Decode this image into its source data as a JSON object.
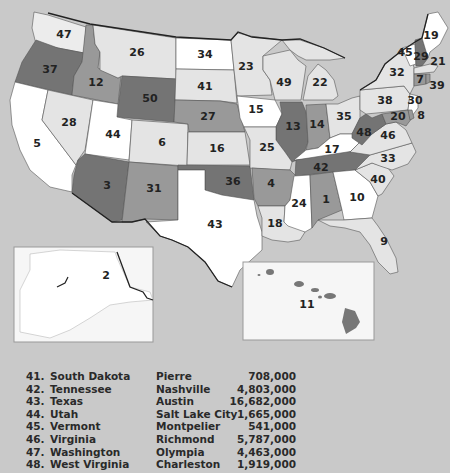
{
  "colors": {
    "background": "#c9c9c9",
    "water": "#c9c9c9",
    "shade_white": "#ffffff",
    "shade_light": "#e4e4e4",
    "shade_medium": "#999999",
    "shade_dark": "#747474",
    "border": "#222222"
  },
  "map": {
    "labels": [
      {
        "num": "47",
        "state": "Washington",
        "x": 64,
        "y": 35
      },
      {
        "num": "37",
        "state": "Oregon",
        "x": 50,
        "y": 70
      },
      {
        "num": "12",
        "state": "Idaho",
        "x": 96,
        "y": 83
      },
      {
        "num": "26",
        "state": "Montana",
        "x": 137,
        "y": 53
      },
      {
        "num": "50",
        "state": "Wyoming",
        "x": 150,
        "y": 99
      },
      {
        "num": "34",
        "state": "North Dakota",
        "x": 205,
        "y": 55
      },
      {
        "num": "41",
        "state": "South Dakota",
        "x": 205,
        "y": 87
      },
      {
        "num": "27",
        "state": "Nebraska",
        "x": 208,
        "y": 117
      },
      {
        "num": "28",
        "state": "Nevada",
        "x": 69,
        "y": 123
      },
      {
        "num": "5",
        "state": "California",
        "x": 37,
        "y": 144
      },
      {
        "num": "44",
        "state": "Utah",
        "x": 113,
        "y": 135
      },
      {
        "num": "6",
        "state": "Colorado",
        "x": 162,
        "y": 143
      },
      {
        "num": "16",
        "state": "Kansas",
        "x": 217,
        "y": 149
      },
      {
        "num": "3",
        "state": "Arizona",
        "x": 107,
        "y": 186
      },
      {
        "num": "31",
        "state": "New Mexico",
        "x": 154,
        "y": 189
      },
      {
        "num": "36",
        "state": "Oklahoma",
        "x": 233,
        "y": 182
      },
      {
        "num": "43",
        "state": "Texas",
        "x": 215,
        "y": 225
      },
      {
        "num": "23",
        "state": "Minnesota",
        "x": 246,
        "y": 67
      },
      {
        "num": "49",
        "state": "Wisconsin",
        "x": 284,
        "y": 83
      },
      {
        "num": "22",
        "state": "Michigan",
        "x": 320,
        "y": 83
      },
      {
        "num": "15",
        "state": "Iowa",
        "x": 256,
        "y": 110
      },
      {
        "num": "13",
        "state": "Illinois",
        "x": 293,
        "y": 127
      },
      {
        "num": "14",
        "state": "Indiana",
        "x": 317,
        "y": 125
      },
      {
        "num": "35",
        "state": "Ohio",
        "x": 344,
        "y": 117
      },
      {
        "num": "25",
        "state": "Missouri",
        "x": 267,
        "y": 148
      },
      {
        "num": "17",
        "state": "Kentucky",
        "x": 332,
        "y": 150
      },
      {
        "num": "42",
        "state": "Tennessee",
        "x": 321,
        "y": 168
      },
      {
        "num": "4",
        "state": "Arkansas",
        "x": 271,
        "y": 184
      },
      {
        "num": "24",
        "state": "Mississippi",
        "x": 299,
        "y": 204
      },
      {
        "num": "1",
        "state": "Alabama",
        "x": 326,
        "y": 200
      },
      {
        "num": "10",
        "state": "Georgia",
        "x": 357,
        "y": 198
      },
      {
        "num": "18",
        "state": "Louisiana",
        "x": 275,
        "y": 224
      },
      {
        "num": "9",
        "state": "Florida",
        "x": 384,
        "y": 242
      },
      {
        "num": "40",
        "state": "South Carolina",
        "x": 378,
        "y": 180
      },
      {
        "num": "33",
        "state": "North Carolina",
        "x": 388,
        "y": 159
      },
      {
        "num": "46",
        "state": "Virginia",
        "x": 388,
        "y": 136
      },
      {
        "num": "48",
        "state": "West Virginia",
        "x": 364,
        "y": 133
      },
      {
        "num": "38",
        "state": "Pennsylvania",
        "x": 385,
        "y": 101
      },
      {
        "num": "32",
        "state": "New York",
        "x": 397,
        "y": 73
      },
      {
        "num": "30",
        "state": "New Jersey",
        "x": 415,
        "y": 101
      },
      {
        "num": "20",
        "state": "Maryland",
        "x": 398,
        "y": 117
      },
      {
        "num": "8",
        "state": "Delaware",
        "x": 421,
        "y": 116
      },
      {
        "num": "19",
        "state": "Maine",
        "x": 431,
        "y": 36
      },
      {
        "num": "45",
        "state": "Vermont",
        "x": 405,
        "y": 53
      },
      {
        "num": "29",
        "state": "New Hampshire",
        "x": 421,
        "y": 57
      },
      {
        "num": "21",
        "state": "Massachusetts",
        "x": 438,
        "y": 62
      },
      {
        "num": "7",
        "state": "Connecticut",
        "x": 420,
        "y": 80
      },
      {
        "num": "39",
        "state": "Rhode Island",
        "x": 437,
        "y": 86
      },
      {
        "num": "2",
        "state": "Alaska",
        "x": 106,
        "y": 276
      },
      {
        "num": "11",
        "state": "Hawaii",
        "x": 307,
        "y": 305
      }
    ]
  },
  "table": {
    "rows": [
      {
        "num": "41.",
        "state": "South Dakota",
        "capital": "Pierre",
        "population": "708,000"
      },
      {
        "num": "42.",
        "state": "Tennessee",
        "capital": "Nashville",
        "population": "4,803,000"
      },
      {
        "num": "43.",
        "state": "Texas",
        "capital": "Austin",
        "population": "16,682,000"
      },
      {
        "num": "44.",
        "state": "Utah",
        "capital": "Salt Lake City",
        "population": "1,665,000"
      },
      {
        "num": "45.",
        "state": "Vermont",
        "capital": "Montpelier",
        "population": "541,000"
      },
      {
        "num": "46.",
        "state": "Virginia",
        "capital": "Richmond",
        "population": "5,787,000"
      },
      {
        "num": "47.",
        "state": "Washington",
        "capital": "Olympia",
        "population": "4,463,000"
      },
      {
        "num": "48.",
        "state": "West Virginia",
        "capital": "Charleston",
        "population": "1,919,000"
      }
    ]
  }
}
